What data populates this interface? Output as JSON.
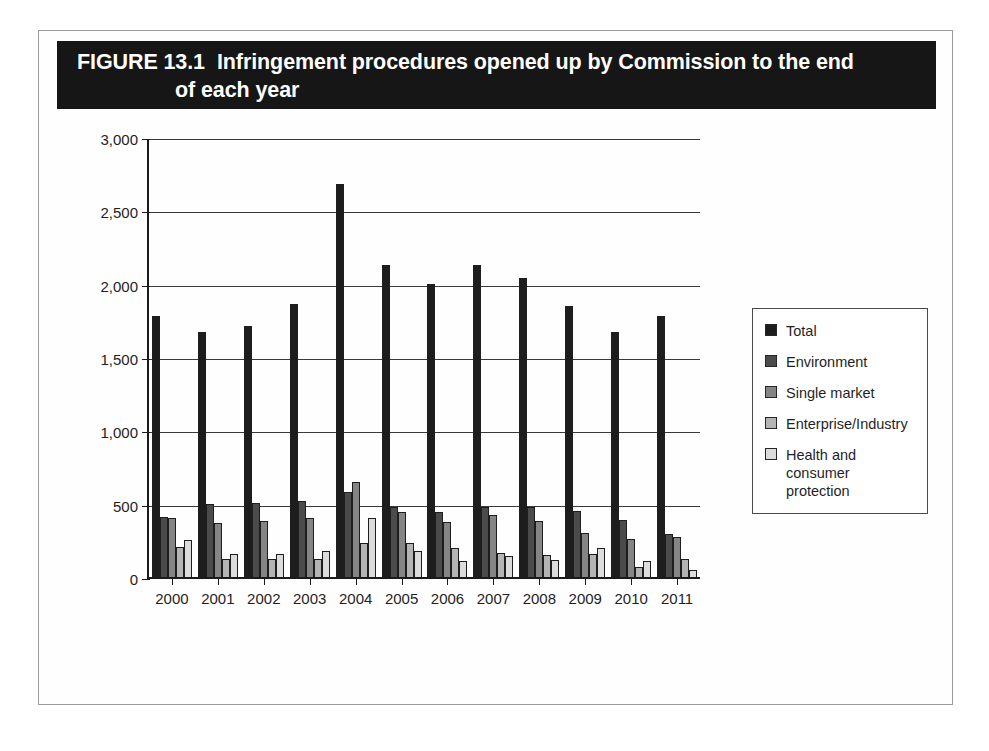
{
  "figure": {
    "number_label": "FIGURE 13.1",
    "title_line1": "Infringement procedures opened up by Commission to the end",
    "title_line2": "of each year",
    "source": "Source: Commission (2001–12). © European Union, 1995–2014."
  },
  "colors": {
    "header_bg": "#161616",
    "header_text": "#ffffff",
    "series_total": "#1d1d1d",
    "series_environment": "#4b4b4b",
    "series_single_market": "#858585",
    "series_enterprise": "#b4b4b4",
    "series_health": "#dcdcdc",
    "axis": "#1b1b1b",
    "grid": "#3a3a3a"
  },
  "legend": {
    "position": "right",
    "items": [
      {
        "label": "Total",
        "swatch": "series_total"
      },
      {
        "label": "Environment",
        "swatch": "series_environment"
      },
      {
        "label": "Single market",
        "swatch": "series_single_market"
      },
      {
        "label": "Enterprise/Industry",
        "swatch": "series_enterprise"
      },
      {
        "label": "Health and consumer protection",
        "swatch": "series_health"
      }
    ]
  },
  "yaxis": {
    "ticks": [
      "3,000",
      "2,500",
      "2,000",
      "1,500",
      "1,000",
      "500",
      "0"
    ],
    "tick_values": [
      3000,
      2500,
      2000,
      1500,
      1000,
      500,
      0
    ]
  },
  "chart_data": {
    "type": "bar",
    "xlabel": "",
    "ylabel": "",
    "ylim": [
      0,
      3000
    ],
    "ytick_interval": 500,
    "grid": true,
    "legend_position": "right",
    "categories": [
      "2000",
      "2001",
      "2002",
      "2003",
      "2004",
      "2005",
      "2006",
      "2007",
      "2008",
      "2009",
      "2010",
      "2011"
    ],
    "series": [
      {
        "name": "Total",
        "values": [
          1780,
          1670,
          1710,
          1860,
          2680,
          2130,
          2000,
          2130,
          2040,
          1850,
          1670,
          1780
        ]
      },
      {
        "name": "Environment",
        "values": [
          410,
          495,
          505,
          515,
          580,
          480,
          440,
          475,
          480,
          450,
          390,
          290
        ]
      },
      {
        "name": "Single market",
        "values": [
          400,
          370,
          380,
          400,
          645,
          440,
          375,
          425,
          380,
          300,
          260,
          275
        ]
      },
      {
        "name": "Enterprise/Industry",
        "values": [
          205,
          125,
          120,
          120,
          230,
          235,
          200,
          165,
          150,
          155,
          70,
          125
        ]
      },
      {
        "name": "Health and consumer protection",
        "values": [
          255,
          160,
          155,
          175,
          405,
          175,
          110,
          140,
          115,
          200,
          110,
          45
        ]
      }
    ],
    "source": "Source: Commission (2001–12). © European Union, 1995–2014."
  }
}
